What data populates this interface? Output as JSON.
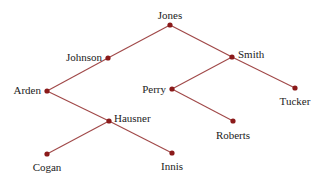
{
  "diagram": {
    "type": "binary-tree",
    "colors": {
      "edge": "#a04848",
      "node": "#8b1a1a",
      "label": "#222222",
      "background": "#ffffff"
    },
    "nodes": [
      {
        "id": "jones",
        "label": "Jones",
        "x": 170,
        "y": 25,
        "label_pos": "above",
        "lx": 170,
        "ly": 16
      },
      {
        "id": "johnson",
        "label": "Johnson",
        "x": 108,
        "y": 58,
        "label_pos": "left",
        "lx": 102,
        "ly": 58
      },
      {
        "id": "smith",
        "label": "Smith",
        "x": 232,
        "y": 57,
        "label_pos": "right",
        "lx": 238,
        "ly": 55
      },
      {
        "id": "arden",
        "label": "Arden",
        "x": 47,
        "y": 91,
        "label_pos": "left",
        "lx": 41,
        "ly": 91
      },
      {
        "id": "perry",
        "label": "Perry",
        "x": 172,
        "y": 89,
        "label_pos": "left",
        "lx": 166,
        "ly": 90
      },
      {
        "id": "tucker",
        "label": "Tucker",
        "x": 295,
        "y": 88,
        "label_pos": "below",
        "lx": 295,
        "ly": 102
      },
      {
        "id": "hausner",
        "label": "Hausner",
        "x": 109,
        "y": 121,
        "label_pos": "right",
        "lx": 114,
        "ly": 119
      },
      {
        "id": "roberts",
        "label": "Roberts",
        "x": 233,
        "y": 121,
        "label_pos": "below",
        "lx": 233,
        "ly": 136
      },
      {
        "id": "cogan",
        "label": "Cogan",
        "x": 47,
        "y": 154,
        "label_pos": "below",
        "lx": 47,
        "ly": 168
      },
      {
        "id": "innis",
        "label": "Innis",
        "x": 172,
        "y": 153,
        "label_pos": "below",
        "lx": 172,
        "ly": 167
      }
    ],
    "edges": [
      {
        "from": "jones",
        "to": "johnson"
      },
      {
        "from": "jones",
        "to": "smith"
      },
      {
        "from": "johnson",
        "to": "arden"
      },
      {
        "from": "smith",
        "to": "perry"
      },
      {
        "from": "smith",
        "to": "tucker"
      },
      {
        "from": "perry",
        "to": "roberts"
      },
      {
        "from": "arden",
        "to": "hausner"
      },
      {
        "from": "hausner",
        "to": "cogan"
      },
      {
        "from": "hausner",
        "to": "innis"
      }
    ]
  }
}
